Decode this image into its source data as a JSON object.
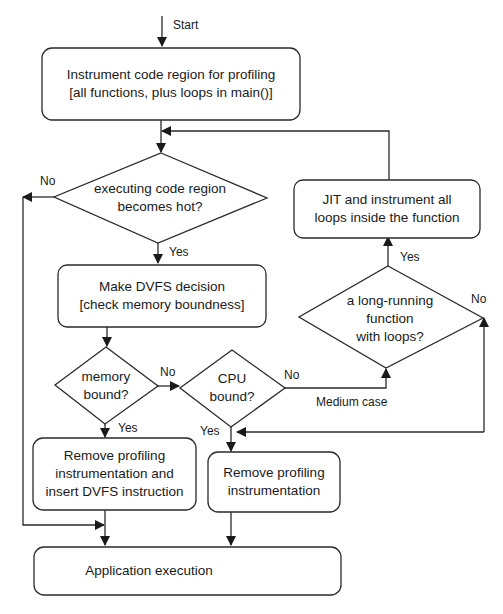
{
  "diagram": {
    "type": "flowchart",
    "start_label": "Start",
    "nodes": {
      "instrument": {
        "line1": "Instrument code region for profiling",
        "line2": "[all functions, plus  loops in main()]"
      },
      "hot": {
        "line1": "executing code region",
        "line2": "becomes hot?"
      },
      "dvfs": {
        "line1": "Make DVFS decision",
        "line2": "[check memory boundness]"
      },
      "memory": {
        "line1": "memory",
        "line2": "bound?"
      },
      "cpu": {
        "line1": "CPU",
        "line2": "bound?"
      },
      "longrun": {
        "line1": "a long-running",
        "line2": "function",
        "line3": "with loops?"
      },
      "jit": {
        "line1": "JIT and  instrument all",
        "line2": "loops inside the function"
      },
      "remove_insert": {
        "line1": "Remove profiling",
        "line2": "instrumentation and",
        "line3": "insert DVFS instruction"
      },
      "remove": {
        "line1": "Remove profiling",
        "line2": "instrumentation"
      },
      "app": {
        "line1": "Application execution"
      }
    },
    "edge_labels": {
      "hot_no": "No",
      "hot_yes": "Yes",
      "memory_no": "No",
      "memory_yes": "Yes",
      "cpu_no": "No",
      "cpu_yes": "Yes",
      "medium_case": "Medium case",
      "longrun_yes": "Yes",
      "longrun_no": "No"
    },
    "colors": {
      "stroke": "#2a2a2a",
      "background": "#ffffff"
    }
  }
}
